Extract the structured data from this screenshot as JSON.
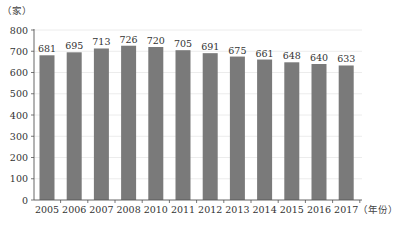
{
  "chart_data": {
    "type": "bar",
    "title": "",
    "ylabel": "（家）",
    "xlabel": "（年份）",
    "categories": [
      "2005",
      "2006",
      "2007",
      "2008",
      "2010",
      "2011",
      "2012",
      "2013",
      "2014",
      "2015",
      "2016",
      "2017"
    ],
    "values": [
      681,
      695,
      713,
      726,
      720,
      705,
      691,
      675,
      661,
      648,
      640,
      633
    ],
    "ylim": [
      0,
      800
    ],
    "yticks": [
      0,
      100,
      200,
      300,
      400,
      500,
      600,
      700,
      800
    ],
    "grid": true,
    "legend": null,
    "data_labels": true
  },
  "colors": {
    "bar": "#7a7a7a",
    "grid": "#ececec",
    "axis": "#555555"
  }
}
